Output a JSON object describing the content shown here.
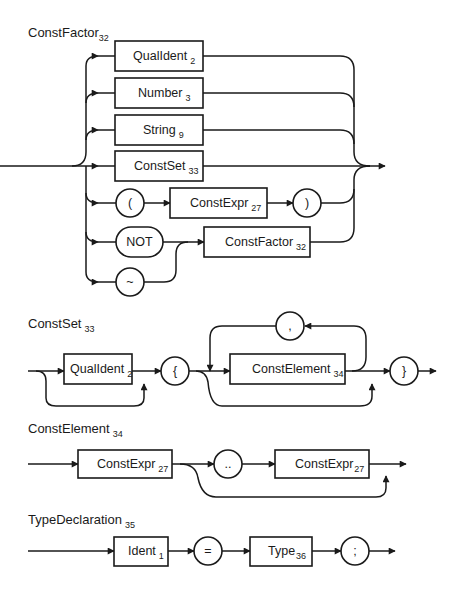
{
  "diagram": {
    "type": "syntax-diagram",
    "productions": [
      {
        "name": "ConstFactor",
        "number": "32",
        "alternatives": [
          [
            {
              "kind": "nonterminal",
              "label": "QualIdent",
              "number": "2"
            }
          ],
          [
            {
              "kind": "nonterminal",
              "label": "Number",
              "number": "3"
            }
          ],
          [
            {
              "kind": "nonterminal",
              "label": "String",
              "number": "9"
            }
          ],
          [
            {
              "kind": "nonterminal",
              "label": "ConstSet",
              "number": "33"
            }
          ],
          [
            {
              "kind": "terminal",
              "label": "("
            },
            {
              "kind": "nonterminal",
              "label": "ConstExpr",
              "number": "27"
            },
            {
              "kind": "terminal",
              "label": ")"
            }
          ],
          [
            {
              "kind": "terminal",
              "label": "NOT"
            },
            {
              "kind": "nonterminal",
              "label": "ConstFactor",
              "number": "32"
            }
          ],
          [
            {
              "kind": "terminal",
              "label": "~"
            },
            {
              "kind": "nonterminal",
              "label": "ConstFactor",
              "number": "32"
            }
          ]
        ]
      },
      {
        "name": "ConstSet",
        "number": "33",
        "sequence": [
          {
            "kind": "nonterminal",
            "label": "QualIdent",
            "number": "2",
            "optional": true
          },
          {
            "kind": "terminal",
            "label": "{"
          },
          {
            "kind": "nonterminal",
            "label": "ConstElement",
            "number": "34",
            "optional": true,
            "repeat_separator": ","
          },
          {
            "kind": "terminal",
            "label": "}"
          }
        ]
      },
      {
        "name": "ConstElement",
        "number": "34",
        "sequence": [
          {
            "kind": "nonterminal",
            "label": "ConstExpr",
            "number": "27"
          },
          {
            "kind": "terminal",
            "label": "..",
            "optional_group_start": true
          },
          {
            "kind": "nonterminal",
            "label": "ConstExpr",
            "number": "27",
            "optional_group_end": true
          }
        ]
      },
      {
        "name": "TypeDeclaration",
        "number": "35",
        "sequence": [
          {
            "kind": "nonterminal",
            "label": "Ident",
            "number": "1"
          },
          {
            "kind": "terminal",
            "label": "="
          },
          {
            "kind": "nonterminal",
            "label": "Type",
            "number": "36"
          },
          {
            "kind": "terminal",
            "label": ";"
          }
        ]
      }
    ]
  },
  "labels": {
    "cf_title": "ConstFactor",
    "cf_title_n": "32",
    "cf_qualident": "QualIdent",
    "cf_qualident_n": "2",
    "cf_number": "Number",
    "cf_number_n": "3",
    "cf_string": "String",
    "cf_string_n": "9",
    "cf_constset": "ConstSet",
    "cf_constset_n": "33",
    "cf_lparen": "(",
    "cf_constexpr": "ConstExpr",
    "cf_constexpr_n": "27",
    "cf_rparen": ")",
    "cf_not": "NOT",
    "cf_constfactor": "ConstFactor",
    "cf_constfactor_n": "32",
    "cf_tilde": "~",
    "cs_title": "ConstSet",
    "cs_title_n": "33",
    "cs_qualident": "QualIdent",
    "cs_qualident_n": "2",
    "cs_lbrace": "{",
    "cs_comma": ",",
    "cs_constelement": "ConstElement",
    "cs_constelement_n": "34",
    "cs_rbrace": "}",
    "ce_title": "ConstElement",
    "ce_title_n": "34",
    "ce_constexpr1": "ConstExpr",
    "ce_constexpr1_n": "27",
    "ce_dots": "..",
    "ce_constexpr2": "ConstExpr",
    "ce_constexpr2_n": "27",
    "td_title": "TypeDeclaration",
    "td_title_n": "35",
    "td_ident": "Ident",
    "td_ident_n": "1",
    "td_equals": "=",
    "td_type": "Type",
    "td_type_n": "36",
    "td_semicolon": ";"
  }
}
